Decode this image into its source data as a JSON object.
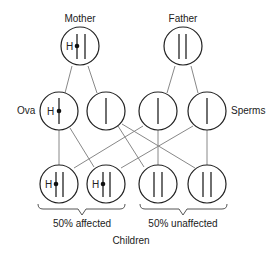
{
  "diagram": {
    "parents": {
      "mother": {
        "label": "Mother",
        "gene_label": "H",
        "chromosomes": "H-marked + normal"
      },
      "father": {
        "label": "Father",
        "chromosomes": "two normal"
      }
    },
    "gametes": {
      "ova_label": "Ova",
      "sperms_label": "Sperms",
      "ova": [
        {
          "gene_label": "H",
          "affected": true
        },
        {
          "gene_label": "",
          "affected": false
        }
      ],
      "sperms": [
        {
          "affected": false
        },
        {
          "affected": false
        }
      ]
    },
    "children": {
      "label": "Children",
      "items": [
        {
          "gene_label": "H",
          "affected": true
        },
        {
          "gene_label": "H",
          "affected": true
        },
        {
          "gene_label": "",
          "affected": false
        },
        {
          "gene_label": "",
          "affected": false
        }
      ],
      "groups": [
        {
          "label": "50% affected"
        },
        {
          "label": "50% unaffected"
        }
      ]
    },
    "colors": {
      "stroke": "#222222",
      "connector": "#888888",
      "background": "#ffffff"
    }
  }
}
